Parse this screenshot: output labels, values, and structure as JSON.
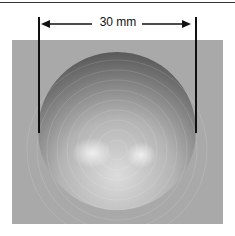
{
  "figure": {
    "dimension_label": "30 mm",
    "colors": {
      "background": "#ffffff",
      "panel": "#a9a9a9",
      "lines": "#111111"
    }
  }
}
